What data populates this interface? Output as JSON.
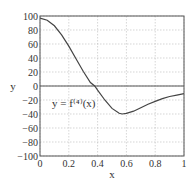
{
  "chart_data": {
    "type": "line",
    "title": "",
    "xlabel": "x",
    "ylabel": "y",
    "xlim": [
      0,
      1
    ],
    "ylim": [
      -100,
      100
    ],
    "xticks": [
      0,
      0.2,
      0.4,
      0.6,
      0.8,
      1
    ],
    "xtick_labels": [
      "0",
      "0.2",
      "0.4",
      "0.6",
      "0.8",
      "1"
    ],
    "yticks": [
      100,
      80,
      60,
      40,
      20,
      0,
      -20,
      -40,
      -60,
      -80,
      -100
    ],
    "ytick_labels": [
      "100",
      "80",
      "60",
      "40",
      "20",
      "0",
      "−20",
      "−40",
      "−60",
      "−80",
      "−100"
    ],
    "grid": true,
    "zero_line": true,
    "annotation": "y = f⁽⁴⁾(x)",
    "series": [
      {
        "name": "y = f(4)(x)",
        "x": [
          0,
          0.05,
          0.1,
          0.15,
          0.2,
          0.25,
          0.3,
          0.35,
          0.38,
          0.4,
          0.45,
          0.5,
          0.55,
          0.57,
          0.6,
          0.65,
          0.7,
          0.75,
          0.8,
          0.85,
          0.9,
          0.95,
          1.0
        ],
        "values": [
          97,
          94,
          86,
          73,
          57,
          39,
          21,
          5,
          0,
          -6,
          -20,
          -32,
          -39,
          -40,
          -39,
          -36,
          -31,
          -26,
          -22,
          -18,
          -15,
          -13,
          -11
        ]
      }
    ]
  }
}
